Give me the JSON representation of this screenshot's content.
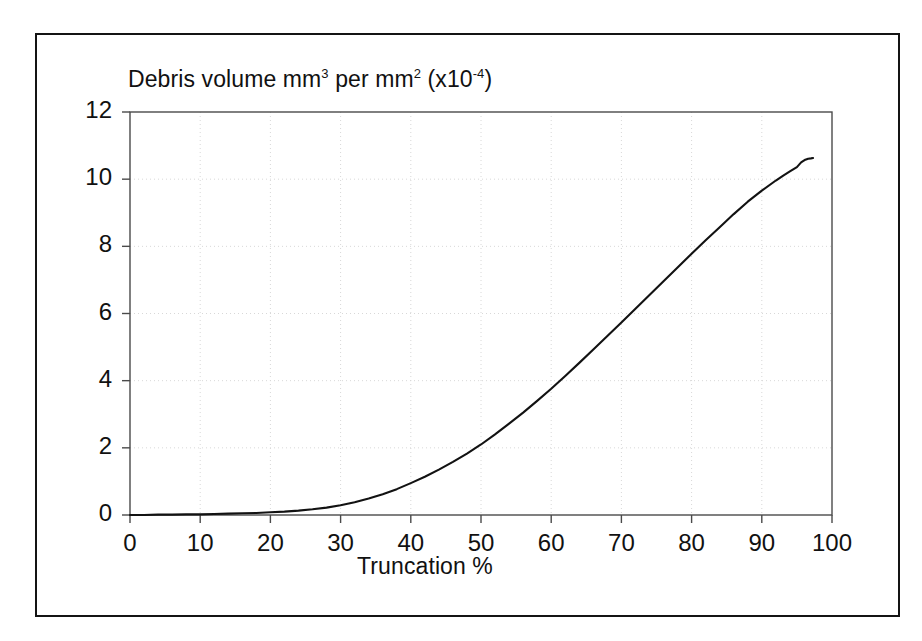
{
  "chart_data": {
    "type": "line",
    "title": "Debris volume mm3 per mm2 (x10-4)",
    "title_parts": {
      "lead": "Debris volume mm",
      "sup1": "3",
      "mid": " per mm",
      "sup2": "2",
      "tail_open": " (x10",
      "sup3": "-4",
      "tail_close": ")"
    },
    "xlabel": "Truncation %",
    "ylabel": "",
    "xlim": [
      0,
      100
    ],
    "ylim": [
      0,
      12
    ],
    "xticks": [
      0,
      10,
      20,
      30,
      40,
      50,
      60,
      70,
      80,
      90,
      100
    ],
    "yticks": [
      0,
      2,
      4,
      6,
      8,
      10,
      12
    ],
    "xtick_labels": [
      "0",
      "10",
      "20",
      "30",
      "40",
      "50",
      "60",
      "70",
      "80",
      "90",
      "100"
    ],
    "ytick_labels": [
      "0",
      "2",
      "4",
      "6",
      "8",
      "10",
      "12"
    ],
    "grid": true,
    "grid_style": "dotted",
    "grid_color": "#d8d8d8",
    "legend": null,
    "series": [
      {
        "name": "Debris volume",
        "color": "#121212",
        "line_width": 2.1,
        "x": [
          0,
          2,
          4,
          6,
          8,
          10,
          12,
          14,
          16,
          18,
          20,
          22,
          24,
          26,
          28,
          30,
          32,
          34,
          36,
          38,
          40,
          42,
          44,
          46,
          48,
          50,
          52,
          54,
          56,
          58,
          60,
          62,
          64,
          66,
          68,
          70,
          72,
          74,
          76,
          78,
          80,
          82,
          84,
          86,
          88,
          90,
          92,
          93,
          94,
          95,
          95.6,
          96.2,
          96.6,
          97,
          97.3
        ],
        "y": [
          0.0,
          0.0,
          0.01,
          0.01,
          0.02,
          0.02,
          0.03,
          0.04,
          0.05,
          0.06,
          0.08,
          0.1,
          0.13,
          0.17,
          0.22,
          0.29,
          0.38,
          0.49,
          0.62,
          0.77,
          0.95,
          1.14,
          1.35,
          1.58,
          1.83,
          2.1,
          2.4,
          2.72,
          3.05,
          3.4,
          3.76,
          4.14,
          4.53,
          4.93,
          5.33,
          5.73,
          6.14,
          6.55,
          6.96,
          7.37,
          7.78,
          8.18,
          8.57,
          8.96,
          9.33,
          9.66,
          9.96,
          10.1,
          10.23,
          10.36,
          10.5,
          10.58,
          10.61,
          10.62,
          10.63
        ]
      }
    ]
  },
  "layout": {
    "plot_left": 130,
    "plot_top": 112,
    "plot_right": 832,
    "plot_bottom": 515,
    "frame_color": "#141414",
    "axis_color": "#4a4a4a"
  }
}
